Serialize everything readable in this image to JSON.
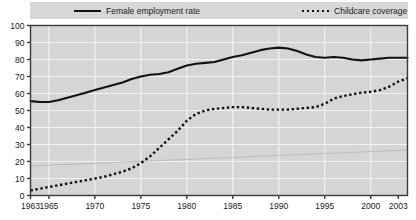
{
  "legend": {
    "entries": [
      {
        "label": "Female employment rate",
        "style": "solid",
        "icon": "solid-line-swatch-icon"
      },
      {
        "label": "Childcare coverage",
        "style": "dotted",
        "icon": "dotted-line-swatch-icon"
      }
    ]
  },
  "colors": {
    "plot_background": "#d5d5d5",
    "gridline": "#f2f2f2",
    "axis": "#3a3a3a",
    "series": "#111111",
    "legend_background": "#d8d8d8",
    "page_background": "#ffffff"
  },
  "chart_data": {
    "type": "line",
    "title": "",
    "xlabel": "",
    "ylabel": "",
    "xlim": [
      1963,
      2004
    ],
    "ylim": [
      0,
      100
    ],
    "grid": true,
    "legend_position": "top",
    "ytick_labels": [
      "0",
      "10",
      "20",
      "30",
      "40",
      "50",
      "60",
      "70",
      "80",
      "90",
      "100"
    ],
    "yticks": [
      0,
      10,
      20,
      30,
      40,
      50,
      60,
      70,
      80,
      90,
      100
    ],
    "xtick_labels": [
      "1963",
      "1965",
      "1970",
      "1975",
      "1980",
      "1985",
      "1990",
      "1995",
      "2000",
      "2003"
    ],
    "xticks": [
      1963,
      1965,
      1970,
      1975,
      1980,
      1985,
      1990,
      1995,
      2000,
      2003
    ],
    "x": [
      1963,
      1964,
      1965,
      1966,
      1967,
      1968,
      1969,
      1970,
      1971,
      1972,
      1973,
      1974,
      1975,
      1976,
      1977,
      1978,
      1979,
      1980,
      1981,
      1982,
      1983,
      1984,
      1985,
      1986,
      1987,
      1988,
      1989,
      1990,
      1991,
      1992,
      1993,
      1994,
      1995,
      1996,
      1997,
      1998,
      1999,
      2000,
      2001,
      2002,
      2003,
      2004
    ],
    "series": [
      {
        "name": "Female employment rate",
        "style": "solid",
        "values": [
          55.5,
          55.0,
          55.0,
          56.0,
          57.5,
          59.0,
          60.5,
          62.0,
          63.5,
          65.0,
          66.5,
          68.5,
          70.0,
          71.0,
          71.5,
          72.5,
          74.5,
          76.5,
          77.5,
          78.0,
          78.5,
          80.0,
          81.5,
          82.5,
          84.0,
          85.5,
          86.5,
          87.0,
          86.5,
          85.0,
          83.0,
          81.5,
          81.0,
          81.5,
          81.0,
          80.0,
          79.5,
          80.0,
          80.5,
          81.0,
          81.0,
          81.0
        ]
      },
      {
        "name": "Childcare coverage",
        "style": "dotted",
        "values": [
          3.0,
          4.0,
          5.0,
          6.0,
          7.0,
          8.0,
          9.0,
          10.0,
          11.0,
          12.5,
          14.0,
          16.0,
          19.0,
          23.0,
          28.0,
          33.0,
          38.0,
          44.0,
          48.0,
          50.0,
          51.0,
          51.5,
          52.0,
          52.0,
          51.5,
          51.0,
          50.5,
          50.5,
          50.5,
          51.0,
          51.5,
          52.0,
          54.0,
          57.0,
          58.5,
          59.5,
          60.5,
          61.0,
          62.0,
          64.0,
          67.0,
          69.0
        ]
      }
    ]
  }
}
